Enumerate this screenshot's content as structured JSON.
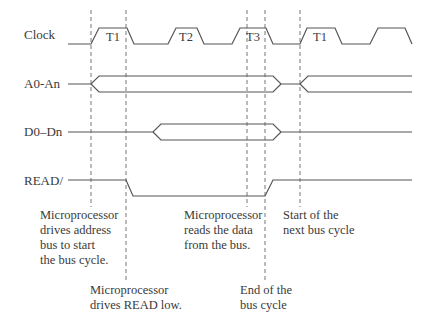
{
  "signals": [
    {
      "label": "Clock"
    },
    {
      "label": "A0-An"
    },
    {
      "label": "D0–Dn"
    },
    {
      "label": "READ/"
    }
  ],
  "clock_periods": [
    "T1",
    "T2",
    "T3",
    "T1"
  ],
  "annotations": [
    {
      "lines": [
        "Microprocessor",
        "drives address",
        "bus to start",
        "the bus cycle."
      ]
    },
    {
      "lines": [
        "Microprocessor",
        "drives READ low."
      ]
    },
    {
      "lines": [
        "Microprocessor",
        "reads the data",
        "from the bus."
      ]
    },
    {
      "lines": [
        "End of the",
        "bus cycle"
      ]
    },
    {
      "lines": [
        "Start of the",
        "next bus cycle"
      ]
    }
  ],
  "colors": {
    "line": "#555555",
    "text": "#3a3a3a",
    "background": "#ffffff"
  }
}
